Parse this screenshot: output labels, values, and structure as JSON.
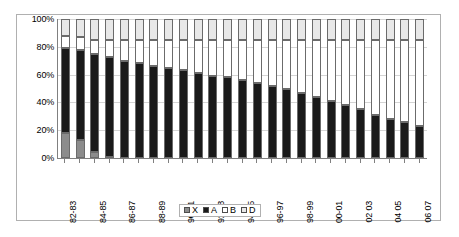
{
  "chart_data": {
    "type": "bar",
    "stacked": true,
    "stack_mode": "percent",
    "title": "",
    "subtitle": "",
    "xlabel": "",
    "ylabel": "",
    "ylim": [
      0,
      100
    ],
    "yticks": [
      0,
      20,
      40,
      60,
      80,
      100
    ],
    "ytick_labels": [
      "0%",
      "20%",
      "40%",
      "60%",
      "80%",
      "100%"
    ],
    "grid": true,
    "grid_axis": "y",
    "legend_position": "bottom-center",
    "categories": [
      "82-83",
      "83-84",
      "84-85",
      "85-86",
      "86-87",
      "87-88",
      "88-89",
      "89-90",
      "90-91",
      "91-92",
      "92-93",
      "93-94",
      "94-95",
      "95-96",
      "96-97",
      "97-98",
      "98-99",
      "99-00",
      "00-01",
      "01 02",
      "02 03",
      "03 04",
      "04 05",
      "05 06",
      "06 07"
    ],
    "xtick_labels_shown": [
      "82-83",
      "84-85",
      "86-87",
      "88-89",
      "90-91",
      "92-93",
      "94-95",
      "96-97",
      "98-99",
      "00-01",
      "02 03",
      "04 05",
      "06 07"
    ],
    "series": [
      {
        "name": "X",
        "color": "#8c8c8c",
        "values": [
          18,
          13,
          4,
          1,
          0,
          0,
          0,
          0,
          0,
          0,
          0,
          0,
          0,
          0,
          0,
          0,
          0,
          0,
          0,
          0,
          0,
          0,
          0,
          0,
          0
        ]
      },
      {
        "name": "A",
        "color": "#1a1a1a",
        "values": [
          61,
          65,
          71,
          72,
          70,
          68,
          66,
          65,
          63,
          61,
          59,
          58,
          56,
          54,
          52,
          50,
          47,
          44,
          41,
          38,
          35,
          31,
          28,
          26,
          23
        ]
      },
      {
        "name": "B",
        "color": "#ffffff",
        "values": [
          9,
          9,
          10,
          12,
          15,
          17,
          19,
          20,
          22,
          24,
          26,
          27,
          29,
          31,
          33,
          35,
          38,
          41,
          44,
          47,
          50,
          54,
          57,
          59,
          62
        ]
      },
      {
        "name": "D",
        "color": "#e8e8e8",
        "values": [
          12,
          13,
          15,
          15,
          15,
          15,
          15,
          15,
          15,
          15,
          15,
          15,
          15,
          15,
          15,
          15,
          15,
          15,
          15,
          15,
          15,
          15,
          15,
          15,
          15
        ]
      }
    ]
  },
  "legend": {
    "items": [
      {
        "label": "X",
        "swatch_class": "sw-x"
      },
      {
        "label": "A",
        "swatch_class": "sw-a"
      },
      {
        "label": "B",
        "swatch_class": "sw-b"
      },
      {
        "label": "D",
        "swatch_class": "sw-d"
      }
    ]
  },
  "colors": {
    "series_x": "#8c8c8c",
    "series_a": "#1a1a1a",
    "series_b": "#ffffff",
    "series_d": "#e8e8e8",
    "gridline": "#d4d4d4",
    "axis": "#808080",
    "border": "#b0b0b0",
    "text": "#000000"
  }
}
